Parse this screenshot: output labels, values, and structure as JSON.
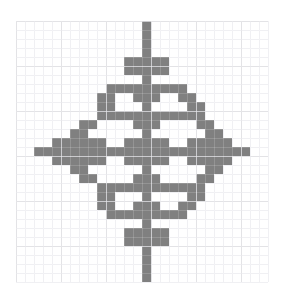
{
  "canvas": {
    "width": 288,
    "height": 300,
    "background": "#ffffff"
  },
  "chart_data": {
    "type": "heatmap",
    "title": "",
    "subtitle": "",
    "xlabel": "",
    "ylabel": "",
    "legend": [],
    "annotations": [],
    "grid": true,
    "grid_color": "#d8d8dc",
    "grid_minor_color": "#eeeef1",
    "grid_line_width": 1,
    "fill_color": "#808080",
    "empty_color": "#ffffff",
    "cell_size": 9,
    "origin_x": 16,
    "origin_y": 21,
    "cols": 28,
    "rows": 29,
    "xlim": [
      0,
      28
    ],
    "ylim": [
      0,
      29
    ],
    "rows_filled": [
      [
        14
      ],
      [
        14
      ],
      [
        14
      ],
      [
        14
      ],
      [
        12,
        13,
        14,
        15,
        16
      ],
      [
        12,
        13,
        14,
        15,
        16
      ],
      [
        14
      ],
      [
        10,
        11,
        12,
        13,
        14,
        15,
        16,
        17,
        18
      ],
      [
        9,
        10,
        13,
        14,
        15,
        18,
        19
      ],
      [
        9,
        10,
        14,
        19,
        20
      ],
      [
        9,
        10,
        11,
        12,
        13,
        14,
        15,
        16,
        17,
        18,
        19,
        20
      ],
      [
        7,
        8,
        13,
        14,
        15,
        20,
        21
      ],
      [
        6,
        7,
        14,
        21,
        22
      ],
      [
        4,
        5,
        6,
        7,
        8,
        9,
        12,
        13,
        14,
        15,
        16,
        19,
        20,
        21,
        22,
        23
      ],
      [
        2,
        3,
        4,
        5,
        6,
        7,
        8,
        9,
        10,
        11,
        12,
        13,
        14,
        15,
        16,
        17,
        18,
        19,
        20,
        21,
        22,
        23,
        24,
        25
      ],
      [
        4,
        5,
        6,
        7,
        8,
        9,
        12,
        13,
        14,
        15,
        16,
        19,
        20,
        21,
        22,
        23
      ],
      [
        6,
        7,
        14,
        21,
        22
      ],
      [
        7,
        8,
        13,
        14,
        15,
        20,
        21
      ],
      [
        9,
        10,
        11,
        12,
        13,
        14,
        15,
        16,
        17,
        18,
        19,
        20
      ],
      [
        9,
        10,
        14,
        19,
        20
      ],
      [
        9,
        10,
        13,
        14,
        15,
        18,
        19
      ],
      [
        10,
        11,
        12,
        13,
        14,
        15,
        16,
        17,
        18
      ],
      [
        14
      ],
      [
        12,
        13,
        14,
        15,
        16
      ],
      [
        12,
        13,
        14,
        15,
        16
      ],
      [
        14
      ],
      [
        14
      ],
      [
        14
      ],
      [
        14
      ]
    ]
  }
}
